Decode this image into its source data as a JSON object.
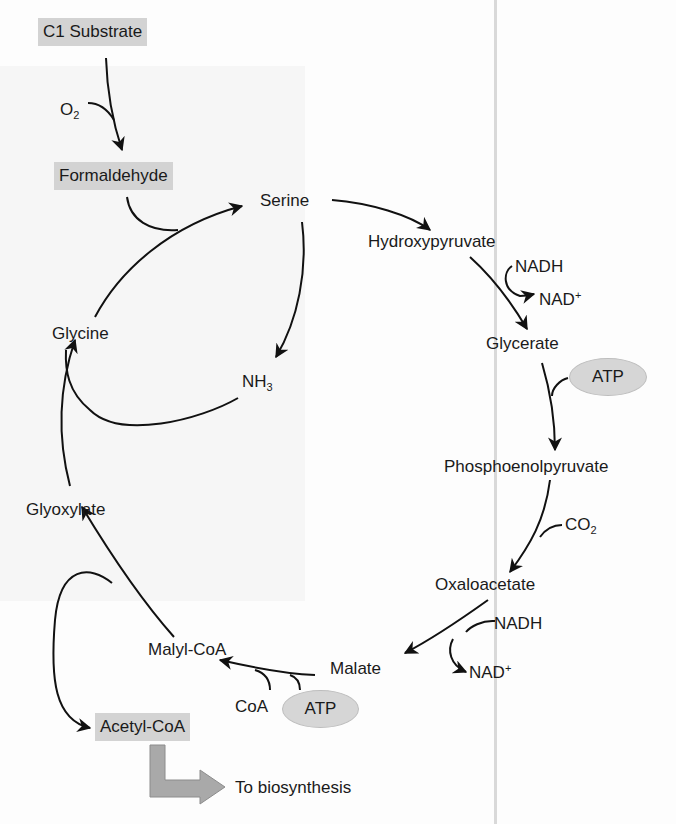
{
  "diagram": {
    "title_boxes": {
      "c1_substrate": "C1 Substrate",
      "formaldehyde": "Formaldehyde",
      "acetyl_coa": "Acetyl-CoA"
    },
    "metabolites": {
      "serine": "Serine",
      "hydroxypyruvate": "Hydroxypyruvate",
      "glycerate": "Glycerate",
      "phosphoenolpyruvate": "Phosphoenolpyruvate",
      "oxaloacetate": "Oxaloacetate",
      "malate": "Malate",
      "malyl_coa": "Malyl-CoA",
      "glyoxylate": "Glyoxylate",
      "glycine": "Glycine"
    },
    "cofactors": {
      "o2_base": "O",
      "o2_sub": "2",
      "nh3_base": "NH",
      "nh3_sub": "3",
      "nadh_1": "NADH",
      "nad_1_base": "NAD",
      "nad_1_sup": "+",
      "atp_1": "ATP",
      "co2_base": "CO",
      "co2_sub": "2",
      "nadh_2": "NADH",
      "nad_2_base": "NAD",
      "nad_2_sup": "+",
      "coa": "CoA",
      "atp_2": "ATP"
    },
    "output_label": "To biosynthesis",
    "colors": {
      "box_fill": "#d3d3d3",
      "oval_fill": "#d6d6d6",
      "arrow": "#111111",
      "big_arrow_fill": "#a9a9a9"
    }
  }
}
